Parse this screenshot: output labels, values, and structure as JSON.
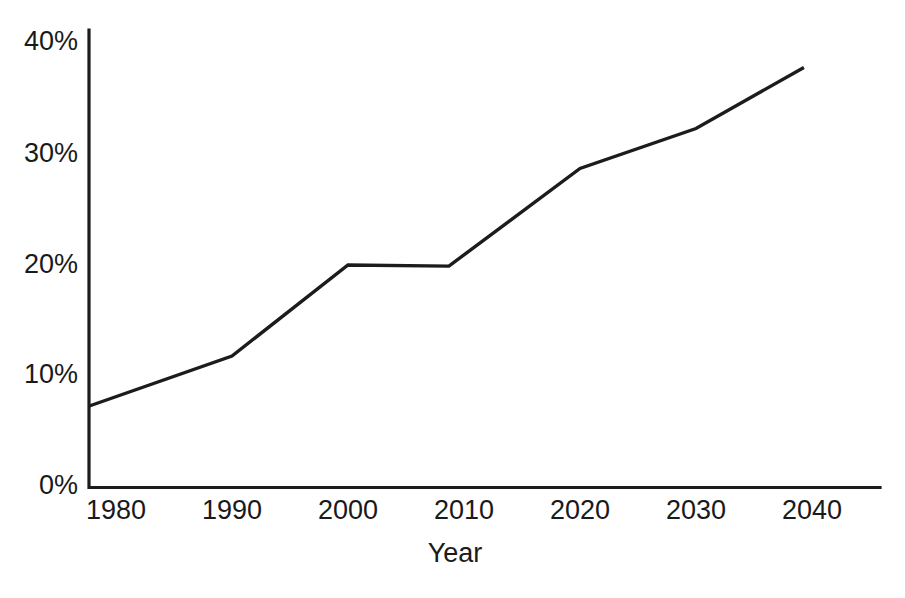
{
  "chart_data": {
    "type": "line",
    "title": "",
    "subtitle": "",
    "xlabel": "Year",
    "ylabel": "",
    "xlim": [
      1977.7,
      2042.0
    ],
    "ylim": [
      0,
      40
    ],
    "grid": false,
    "legend": false,
    "legend_position": "none",
    "x_tick_labels": [
      "1980",
      "1990",
      "2000",
      "2010",
      "2020",
      "2030",
      "2040"
    ],
    "x_ticks": [
      1980,
      1990,
      2000,
      2010,
      2020,
      2030,
      2040
    ],
    "y_tick_labels": [
      "0%",
      "10%",
      "20%",
      "30%",
      "40%"
    ],
    "y_ticks": [
      0,
      10,
      20,
      30,
      40
    ],
    "y_unit": "%",
    "series": [
      {
        "name": "",
        "color": "#1c1c1c",
        "x": [
          1977.7,
          1990.0,
          2000.0,
          2008.7,
          2020.0,
          2030.0,
          2039.3
        ],
        "values": [
          7.3,
          11.8,
          20.0,
          19.9,
          28.7,
          32.3,
          37.8
        ]
      }
    ],
    "annotations": []
  },
  "axes": {
    "x_axis_title": "Year",
    "y_axis_title": ""
  }
}
